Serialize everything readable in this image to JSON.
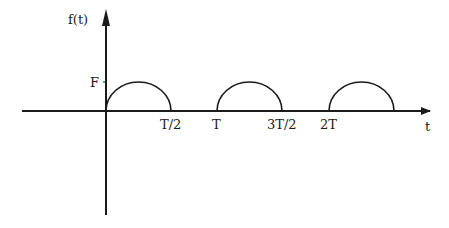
{
  "diagram": {
    "y_axis_label": "f(t)",
    "x_axis_label": "t",
    "amplitude_label": "F",
    "x_ticks": [
      {
        "label": "T/2",
        "x": 171
      },
      {
        "label": "T",
        "x": 217
      },
      {
        "label": "3T/2",
        "x": 282
      },
      {
        "label": "2T",
        "x": 329
      }
    ],
    "pulses": [
      {
        "start": "0",
        "end": "T/2"
      },
      {
        "start": "T",
        "end": "3T/2"
      },
      {
        "start": "2T",
        "end": "5T/2"
      }
    ],
    "colors": {
      "stroke": "#1a1a1a",
      "background": "#ffffff"
    }
  }
}
